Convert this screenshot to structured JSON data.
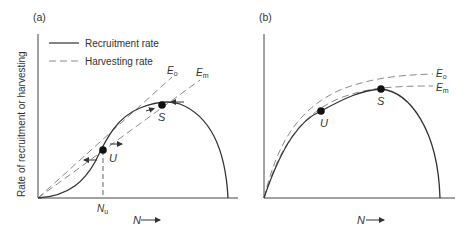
{
  "figure": {
    "panels": [
      {
        "id": "a",
        "label": "(a)",
        "y_axis_label": "Rate of recruitment or harvesting",
        "x_axis_label": "N",
        "x_axis_arrow": "→",
        "legend": [
          {
            "label": "Recruitment rate",
            "style": "solid"
          },
          {
            "label": "Harvesting rate",
            "style": "dashed"
          }
        ],
        "curves": {
          "recruitment": "S-shaped (depensatory) recruitment curve",
          "Eo": {
            "label_main": "E",
            "label_sub": "o",
            "type": "straight line"
          },
          "Em": {
            "label_main": "E",
            "label_sub": "m",
            "type": "straight line"
          }
        },
        "points": [
          {
            "name": "U",
            "meaning": "unstable equilibrium"
          },
          {
            "name": "S",
            "meaning": "stable equilibrium"
          }
        ],
        "marker": {
          "main": "N",
          "sub": "u"
        }
      },
      {
        "id": "b",
        "label": "(b)",
        "x_axis_label": "N",
        "x_axis_arrow": "→",
        "curves": {
          "recruitment": "domed recruitment curve",
          "Eo": {
            "label_main": "E",
            "label_sub": "o",
            "type": "curved"
          },
          "Em": {
            "label_main": "E",
            "label_sub": "m",
            "type": "curved"
          }
        },
        "points": [
          {
            "name": "U"
          },
          {
            "name": "S"
          }
        ]
      }
    ],
    "colors": {
      "recruitment": "#333333",
      "harvesting": "#8a8a8a",
      "axes": "#444444",
      "point": "#111111"
    }
  }
}
